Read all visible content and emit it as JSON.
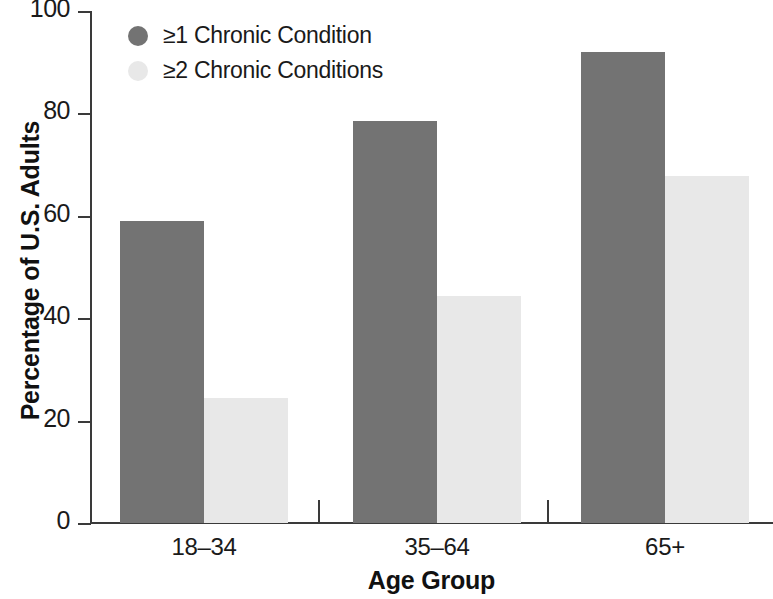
{
  "chart_data": {
    "type": "bar",
    "title": "",
    "subtitle": "",
    "xlabel": "Age Group",
    "ylabel": "Percentage of U.S. Adults",
    "categories": [
      "18–34",
      "35–64",
      "65+"
    ],
    "series": [
      {
        "name": "≥1 Chronic Condition",
        "color": "#737373",
        "values": [
          59,
          78.5,
          92
        ]
      },
      {
        "name": "≥2 Chronic Conditions",
        "color": "#e8e8e8",
        "values": [
          24.5,
          44.3,
          67.8
        ]
      }
    ],
    "ylim": [
      0,
      100
    ],
    "ytick_labels": [
      "100",
      "80",
      "60",
      "40",
      "20",
      "0"
    ],
    "ytick_values": [
      100,
      80,
      60,
      40,
      20,
      0
    ],
    "grid": false,
    "legend_position": "top-left",
    "axis_color": "#3a3a3a"
  }
}
